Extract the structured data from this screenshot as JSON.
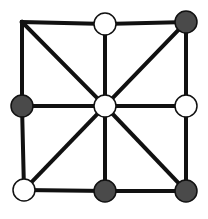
{
  "board": {
    "line_color": "#111111",
    "line_width": 4,
    "nodes": [
      {
        "id": "top-left",
        "x": 22,
        "y": 22,
        "piece": "none"
      },
      {
        "id": "top-mid",
        "x": 105,
        "y": 24,
        "piece": "white"
      },
      {
        "id": "top-right",
        "x": 186,
        "y": 22,
        "piece": "black"
      },
      {
        "id": "mid-left",
        "x": 22,
        "y": 106,
        "piece": "black"
      },
      {
        "id": "center",
        "x": 105,
        "y": 106,
        "piece": "white"
      },
      {
        "id": "mid-right",
        "x": 186,
        "y": 106,
        "piece": "white"
      },
      {
        "id": "bottom-left",
        "x": 24,
        "y": 190,
        "piece": "white"
      },
      {
        "id": "bottom-mid",
        "x": 105,
        "y": 191,
        "piece": "black"
      },
      {
        "id": "bottom-right",
        "x": 186,
        "y": 191,
        "piece": "black"
      }
    ],
    "edges": [
      [
        "top-left",
        "top-mid"
      ],
      [
        "top-mid",
        "top-right"
      ],
      [
        "mid-left",
        "center"
      ],
      [
        "center",
        "mid-right"
      ],
      [
        "bottom-left",
        "bottom-mid"
      ],
      [
        "bottom-mid",
        "bottom-right"
      ],
      [
        "top-left",
        "mid-left"
      ],
      [
        "mid-left",
        "bottom-left"
      ],
      [
        "top-mid",
        "center"
      ],
      [
        "center",
        "bottom-mid"
      ],
      [
        "top-right",
        "mid-right"
      ],
      [
        "mid-right",
        "bottom-right"
      ],
      [
        "top-left",
        "center"
      ],
      [
        "center",
        "bottom-right"
      ],
      [
        "top-right",
        "center"
      ],
      [
        "center",
        "bottom-left"
      ]
    ],
    "piece_colors": {
      "white": "#ffffff",
      "black": "#4a4a4a",
      "stroke": "#111111"
    },
    "piece_radius": 11
  }
}
